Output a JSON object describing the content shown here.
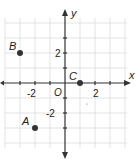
{
  "diagram": {
    "type": "coordinate-plane",
    "x_axis_label": "x",
    "y_axis_label": "y",
    "origin_label": "O",
    "x_range": [
      -4,
      4
    ],
    "y_range": [
      -4,
      4
    ],
    "tick_labels": {
      "x": [
        "-2",
        "2"
      ],
      "y": [
        "2",
        "-2"
      ]
    },
    "points": [
      {
        "label": "A",
        "x": -2,
        "y": -3
      },
      {
        "label": "B",
        "x": -3,
        "y": 2
      },
      {
        "label": "C",
        "x": 1,
        "y": 0
      }
    ],
    "colors": {
      "grid": "#dcdcdc",
      "axis": "#333333",
      "point": "#333333"
    }
  }
}
